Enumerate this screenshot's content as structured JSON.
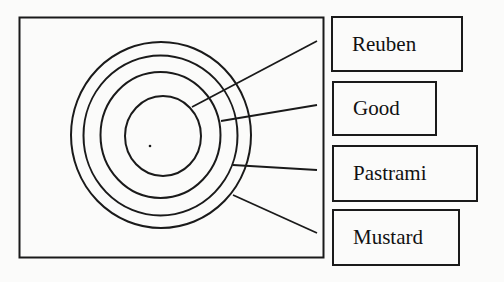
{
  "diagram": {
    "type": "concentric-circle-labeling",
    "frame": {
      "x": 19,
      "y": 17,
      "width": 304,
      "height": 241
    },
    "center_dot": {
      "x": 150,
      "y": 146
    },
    "circles": [
      {
        "name": "outer-ring-4",
        "cx": 161,
        "cy": 135,
        "rx": 90,
        "ry": 93
      },
      {
        "name": "ring-3",
        "cx": 160.5,
        "cy": 135.5,
        "rx": 77,
        "ry": 80
      },
      {
        "name": "ring-2",
        "cx": 160.5,
        "cy": 135,
        "rx": 60,
        "ry": 63
      },
      {
        "name": "inner-ring-1",
        "cx": 163,
        "cy": 136,
        "rx": 38,
        "ry": 40
      }
    ],
    "leaders": [
      {
        "label": "Reuben",
        "x1": 192,
        "y1": 107,
        "x2": 317,
        "y2": 41
      },
      {
        "label": "Good",
        "x1": 221,
        "y1": 121,
        "x2": 317,
        "y2": 105
      },
      {
        "label": "Pastrami",
        "x1": 233,
        "y1": 165,
        "x2": 317,
        "y2": 170
      },
      {
        "label": "Mustard",
        "x1": 233,
        "y1": 195,
        "x2": 317,
        "y2": 233
      }
    ],
    "labels": [
      {
        "text": "Reuben",
        "x": 331,
        "y": 16,
        "width": 132,
        "height": 56
      },
      {
        "text": "Good",
        "x": 332,
        "y": 81,
        "width": 105,
        "height": 55
      },
      {
        "text": "Pastrami",
        "x": 332,
        "y": 145,
        "width": 146,
        "height": 57
      },
      {
        "text": "Mustard",
        "x": 332,
        "y": 209,
        "width": 128,
        "height": 57
      }
    ],
    "colors": {
      "stroke": "#1a1a1a",
      "background": "#fbfbfa"
    }
  }
}
